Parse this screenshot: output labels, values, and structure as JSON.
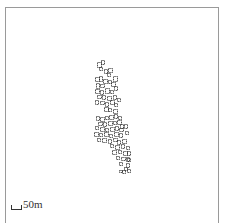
{
  "map": {
    "type": "building-footprints",
    "stroke_color": "#222222",
    "frame_color": "#9a9a9a",
    "scale_bar": {
      "label": "50m",
      "length_px": 11
    },
    "buildings": [
      [
        97,
        62,
        4,
        5
      ],
      [
        101,
        60,
        3,
        4
      ],
      [
        99,
        67,
        3,
        3
      ],
      [
        104,
        69,
        3,
        4
      ],
      [
        108,
        68,
        4,
        4
      ],
      [
        107,
        73,
        3,
        3
      ],
      [
        113,
        76,
        4,
        5
      ],
      [
        95,
        77,
        4,
        4
      ],
      [
        99,
        76,
        3,
        5
      ],
      [
        103,
        79,
        4,
        4
      ],
      [
        108,
        80,
        3,
        3
      ],
      [
        111,
        82,
        4,
        4
      ],
      [
        96,
        83,
        3,
        5
      ],
      [
        100,
        84,
        4,
        3
      ],
      [
        114,
        86,
        3,
        4
      ],
      [
        95,
        89,
        4,
        4
      ],
      [
        100,
        90,
        3,
        4
      ],
      [
        105,
        88,
        4,
        5
      ],
      [
        110,
        90,
        3,
        3
      ],
      [
        97,
        95,
        4,
        3
      ],
      [
        102,
        95,
        3,
        4
      ],
      [
        107,
        96,
        4,
        4
      ],
      [
        113,
        95,
        3,
        4
      ],
      [
        117,
        98,
        3,
        3
      ],
      [
        95,
        100,
        3,
        4
      ],
      [
        100,
        101,
        4,
        3
      ],
      [
        105,
        102,
        3,
        4
      ],
      [
        110,
        100,
        4,
        4
      ],
      [
        114,
        103,
        3,
        3
      ],
      [
        104,
        107,
        4,
        4
      ],
      [
        108,
        108,
        3,
        3
      ],
      [
        113,
        109,
        4,
        4
      ],
      [
        96,
        116,
        3,
        4
      ],
      [
        100,
        117,
        4,
        4
      ],
      [
        105,
        116,
        3,
        3
      ],
      [
        109,
        115,
        4,
        4
      ],
      [
        114,
        114,
        3,
        4
      ],
      [
        118,
        116,
        3,
        3
      ],
      [
        117,
        120,
        4,
        4
      ],
      [
        113,
        121,
        3,
        3
      ],
      [
        98,
        122,
        4,
        3
      ],
      [
        103,
        122,
        3,
        4
      ],
      [
        108,
        121,
        4,
        4
      ],
      [
        120,
        124,
        3,
        4
      ],
      [
        95,
        126,
        3,
        3
      ],
      [
        100,
        127,
        4,
        4
      ],
      [
        105,
        128,
        3,
        3
      ],
      [
        110,
        127,
        4,
        4
      ],
      [
        115,
        126,
        3,
        4
      ],
      [
        119,
        128,
        4,
        3
      ],
      [
        124,
        124,
        3,
        4
      ],
      [
        94,
        132,
        4,
        4
      ],
      [
        99,
        133,
        3,
        3
      ],
      [
        104,
        132,
        4,
        4
      ],
      [
        109,
        134,
        3,
        3
      ],
      [
        114,
        132,
        4,
        4
      ],
      [
        119,
        133,
        3,
        4
      ],
      [
        125,
        131,
        3,
        3
      ],
      [
        97,
        138,
        3,
        3
      ],
      [
        102,
        138,
        4,
        4
      ],
      [
        108,
        139,
        3,
        4
      ],
      [
        113,
        138,
        4,
        3
      ],
      [
        117,
        140,
        3,
        4
      ],
      [
        122,
        139,
        4,
        4
      ],
      [
        110,
        144,
        3,
        3
      ],
      [
        115,
        145,
        4,
        4
      ],
      [
        121,
        144,
        3,
        4
      ],
      [
        126,
        146,
        3,
        3
      ],
      [
        112,
        150,
        4,
        4
      ],
      [
        118,
        150,
        3,
        3
      ],
      [
        123,
        151,
        4,
        4
      ],
      [
        127,
        151,
        3,
        4
      ],
      [
        116,
        156,
        3,
        3
      ],
      [
        121,
        157,
        4,
        3
      ],
      [
        126,
        157,
        3,
        4
      ],
      [
        119,
        162,
        3,
        3
      ],
      [
        126,
        163,
        3,
        4
      ],
      [
        127,
        158,
        3,
        3
      ],
      [
        124,
        167,
        3,
        3
      ],
      [
        119,
        170,
        3,
        2
      ],
      [
        122,
        170,
        3,
        3
      ],
      [
        127,
        169,
        3,
        3
      ]
    ]
  }
}
